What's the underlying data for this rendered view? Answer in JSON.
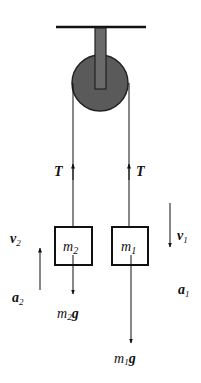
{
  "diagram": {
    "colors": {
      "line": "#111111",
      "pulley_fill": "#5a5a5a",
      "background": "#ffffff"
    },
    "pulley": {
      "label": "pulley"
    },
    "tension_left": {
      "symbol": "T"
    },
    "tension_right": {
      "symbol": "T"
    },
    "mass_left": {
      "base": "m",
      "sub": "2"
    },
    "mass_right": {
      "base": "m",
      "sub": "1"
    },
    "velocity_left": {
      "base": "v",
      "sub": "2"
    },
    "velocity_right": {
      "base": "v",
      "sub": "1"
    },
    "accel_left": {
      "base": "a",
      "sub": "2"
    },
    "accel_right": {
      "base": "a",
      "sub": "1"
    },
    "weight_left": {
      "base": "m",
      "sub": "2",
      "tail": "g"
    },
    "weight_right": {
      "base": "m",
      "sub": "1",
      "tail": "g"
    }
  }
}
